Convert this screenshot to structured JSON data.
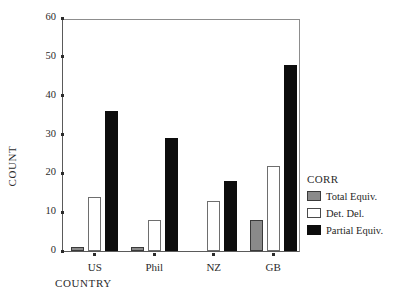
{
  "chart_data": {
    "type": "bar",
    "title": "",
    "subtitle": "",
    "xlabel": "COUNTRY",
    "ylabel": "COUNT",
    "categories": [
      "US",
      "Phil",
      "NZ",
      "GB"
    ],
    "ylim": [
      0,
      60
    ],
    "yticks": [
      0,
      10,
      20,
      30,
      40,
      50,
      60
    ],
    "grid": false,
    "legend_position": "right",
    "legend_title": "CORR",
    "series": [
      {
        "name": "Total Equiv.",
        "color": "#8a8a8a",
        "values": [
          1,
          1,
          0,
          8
        ]
      },
      {
        "name": "Det. Del.",
        "color": "#ffffff",
        "values": [
          14,
          8,
          13,
          22
        ]
      },
      {
        "name": "Partial Equiv.",
        "color": "#0d0d0d",
        "values": [
          36,
          29,
          18,
          48
        ]
      }
    ]
  }
}
